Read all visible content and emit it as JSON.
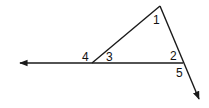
{
  "diagram": {
    "type": "geometry-angles",
    "angle_labels": [
      "1",
      "2",
      "3",
      "4",
      "5"
    ],
    "stroke_color": "#1a1a1a",
    "label_color": "#111111"
  }
}
